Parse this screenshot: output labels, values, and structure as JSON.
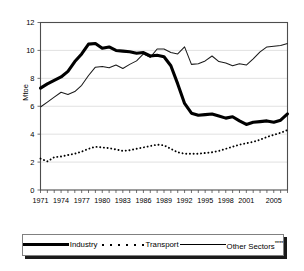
{
  "chart_data": {
    "type": "line",
    "title": "",
    "xlabel": "",
    "ylabel": "Mtoe",
    "ylim": [
      0,
      12
    ],
    "yticks": [
      0,
      2,
      4,
      6,
      8,
      10,
      12
    ],
    "xlim": [
      1971,
      2007
    ],
    "xticks": [
      1971,
      1974,
      1977,
      1980,
      1983,
      1986,
      1989,
      1992,
      1995,
      1998,
      2001,
      2005
    ],
    "xtick_labels": [
      "1971",
      "1974",
      "1977",
      "1980",
      "1983",
      "1986",
      "1989",
      "1992",
      "1995",
      "1998",
      "2001",
      "2005"
    ],
    "ytick_labels": [
      "0",
      "2",
      "4",
      "6",
      "8",
      "10",
      "12"
    ],
    "grid": "horizontal",
    "legend_position": "bottom",
    "x": [
      1971,
      1972,
      1973,
      1974,
      1975,
      1976,
      1977,
      1978,
      1979,
      1980,
      1981,
      1982,
      1983,
      1984,
      1985,
      1986,
      1987,
      1988,
      1989,
      1990,
      1991,
      1992,
      1993,
      1994,
      1995,
      1996,
      1997,
      1998,
      1999,
      2000,
      2001,
      2002,
      2003,
      2004,
      2005,
      2006,
      2007
    ],
    "series": [
      {
        "name": "Industry",
        "style": "thick-solid",
        "color": "#000000",
        "values": [
          7.3,
          7.6,
          7.85,
          8.1,
          8.5,
          9.2,
          9.75,
          10.45,
          10.5,
          10.15,
          10.25,
          10.0,
          9.95,
          9.9,
          9.8,
          9.85,
          9.6,
          9.65,
          9.55,
          8.9,
          7.6,
          6.2,
          5.5,
          5.35,
          5.4,
          5.45,
          5.3,
          5.15,
          5.25,
          4.95,
          4.7,
          4.85,
          4.9,
          4.95,
          4.85,
          5.0,
          5.45
        ]
      },
      {
        "name": "Transport",
        "style": "dotted",
        "color": "#000000",
        "values": [
          2.25,
          2.05,
          2.35,
          2.4,
          2.5,
          2.6,
          2.75,
          2.95,
          3.1,
          3.05,
          3.0,
          2.9,
          2.8,
          2.85,
          2.95,
          3.05,
          3.15,
          3.25,
          3.2,
          2.95,
          2.7,
          2.6,
          2.6,
          2.6,
          2.65,
          2.7,
          2.8,
          2.95,
          3.1,
          3.25,
          3.35,
          3.45,
          3.6,
          3.8,
          3.95,
          4.1,
          4.3
        ]
      },
      {
        "name": "Other Sectors****",
        "style": "thin-solid",
        "color": "#1a1a1a",
        "values": [
          5.95,
          6.3,
          6.65,
          7.0,
          6.85,
          7.05,
          7.5,
          8.2,
          8.8,
          8.85,
          8.75,
          8.95,
          8.7,
          9.0,
          9.25,
          9.75,
          9.5,
          10.1,
          10.1,
          9.85,
          9.75,
          10.25,
          9.0,
          9.05,
          9.25,
          9.6,
          9.2,
          9.1,
          8.9,
          9.05,
          8.95,
          9.4,
          9.9,
          10.25,
          10.3,
          10.35,
          10.5
        ]
      }
    ],
    "legend": [
      {
        "label": "Industry",
        "style": "thick-solid"
      },
      {
        "label": "Transport",
        "style": "dotted"
      },
      {
        "label": "Other Sectors",
        "suffix": "****",
        "style": "thin-solid"
      }
    ]
  }
}
